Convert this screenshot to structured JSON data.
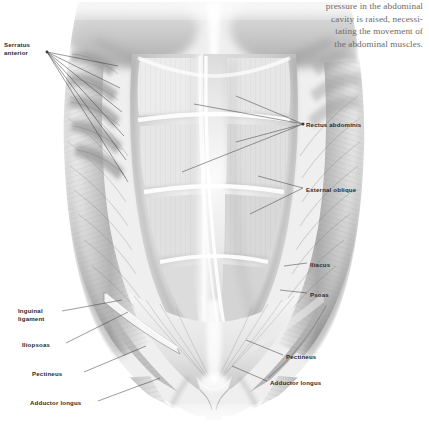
{
  "figure": {
    "background_color": "#ffffff"
  },
  "caption": {
    "color": "#6d6a66",
    "lines": [
      "pressure in the abdominal",
      "cavity is raised, necessi-",
      "tating the movement of",
      "the abdominal muscles."
    ]
  },
  "labels": {
    "color": "#2b2b2b",
    "left": [
      {
        "id": "serratus-anterior",
        "text_lines": [
          "Serratus",
          "anterior"
        ],
        "x": 4,
        "y": 41
      },
      {
        "id": "inguinal-ligament",
        "text_lines": [
          "Inguinal",
          "ligament"
        ],
        "x": 18,
        "y": 307
      },
      {
        "id": "iliopsoas",
        "text_lines": [
          "Iliopsoas"
        ],
        "x": 22,
        "y": 341
      },
      {
        "id": "pectineus-left",
        "text_lines": [
          "Pectineus"
        ],
        "x": 32,
        "y": 370
      },
      {
        "id": "adductor-longus-left",
        "text_lines": [
          "Adductor longus"
        ],
        "x": 30,
        "y": 399
      }
    ],
    "right": [
      {
        "id": "rectus-abdominis",
        "text_lines": [
          "Rectus abdominis"
        ],
        "x": 306,
        "y": 121
      },
      {
        "id": "external-oblique",
        "text_lines": [
          "External oblique"
        ],
        "x": 306,
        "y": 186
      },
      {
        "id": "iliacus",
        "text_lines": [
          "Iliacus"
        ],
        "x": 310,
        "y": 261
      },
      {
        "id": "psoas",
        "text_lines": [
          "Psoas"
        ],
        "x": 310,
        "y": 291
      },
      {
        "id": "pectineus-right",
        "text_lines": [
          "Pectineus"
        ],
        "x": 286,
        "y": 353
      },
      {
        "id": "adductor-longus-right",
        "text_lines": [
          "Adductor longus"
        ],
        "x": 270,
        "y": 379
      }
    ]
  },
  "anatomy": {
    "structures": [
      "rectus abdominis",
      "tendinous intersections",
      "linea alba",
      "external oblique",
      "serratus anterior",
      "inguinal ligament",
      "iliopsoas",
      "iliacus",
      "psoas",
      "pectineus",
      "adductor longus",
      "pubic symphysis"
    ],
    "shading": {
      "light": "#fdfdfd",
      "mid": "#c9c9c9",
      "dark": "#7c7c7c",
      "deep": "#4a4a4a"
    }
  }
}
